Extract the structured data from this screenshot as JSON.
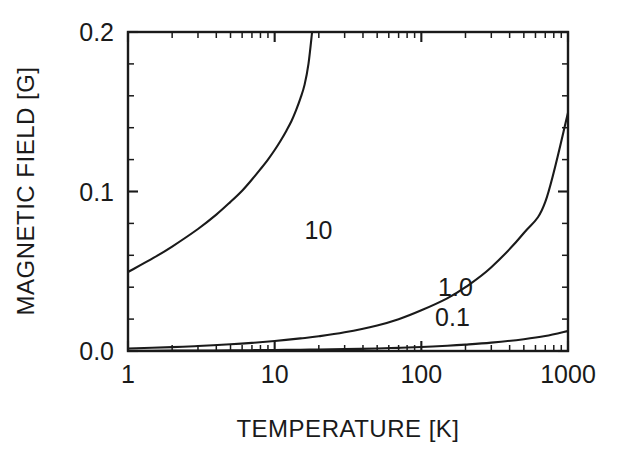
{
  "chart_data": {
    "type": "line",
    "title": "",
    "xlabel": "TEMPERATURE [K]",
    "ylabel": "MAGNETIC FIELD [G]",
    "xscale": "log",
    "yscale": "linear",
    "xlim": [
      1,
      1000
    ],
    "ylim": [
      0.0,
      0.2
    ],
    "grid": false,
    "legend": "inline-curve-labels",
    "xticks": [
      1,
      10,
      100,
      1000
    ],
    "xtick_labels": [
      "1",
      "10",
      "100",
      "1000"
    ],
    "yticks": [
      0.0,
      0.1,
      0.2
    ],
    "ytick_labels": [
      "0.0",
      "0.1",
      "0.2"
    ],
    "yminor_step": 0.02,
    "series": [
      {
        "name": "10",
        "label": "10",
        "label_x": 16,
        "label_y": 0.0705,
        "x": [
          1,
          1.5,
          2,
          3,
          4,
          5,
          6,
          7,
          8,
          9,
          10,
          11,
          12,
          13,
          14,
          15,
          16,
          17,
          18
        ],
        "y": [
          0.0495,
          0.0585,
          0.0655,
          0.0765,
          0.0855,
          0.0935,
          0.1005,
          0.1075,
          0.114,
          0.12,
          0.126,
          0.132,
          0.138,
          0.144,
          0.151,
          0.1585,
          0.167,
          0.18,
          0.2
        ]
      },
      {
        "name": "1.0",
        "label": "1.0",
        "label_x": 130,
        "label_y": 0.0345,
        "x": [
          1,
          2,
          3,
          5,
          7,
          10,
          15,
          20,
          30,
          50,
          70,
          100,
          150,
          200,
          300,
          500,
          700,
          1000
        ],
        "y": [
          0.0016,
          0.0024,
          0.0031,
          0.0042,
          0.0051,
          0.0063,
          0.0079,
          0.0092,
          0.0117,
          0.016,
          0.0199,
          0.0255,
          0.033,
          0.04,
          0.0525,
          0.074,
          0.0935,
          0.1494
        ]
      },
      {
        "name": "0.1",
        "label": "0.1",
        "label_x": 124,
        "label_y": 0.0155,
        "x": [
          1,
          2,
          3,
          5,
          7,
          10,
          15,
          20,
          30,
          50,
          70,
          100,
          150,
          200,
          300,
          500,
          700,
          1000
        ],
        "y": [
          0.00016,
          0.00024,
          0.00031,
          0.00042,
          0.00051,
          0.00063,
          0.00079,
          0.00092,
          0.00117,
          0.0016,
          0.00199,
          0.00255,
          0.0033,
          0.004,
          0.00525,
          0.0074,
          0.00935,
          0.0125
        ]
      }
    ]
  },
  "colors": {
    "ink": "#1a1a1a",
    "background": "#ffffff"
  }
}
